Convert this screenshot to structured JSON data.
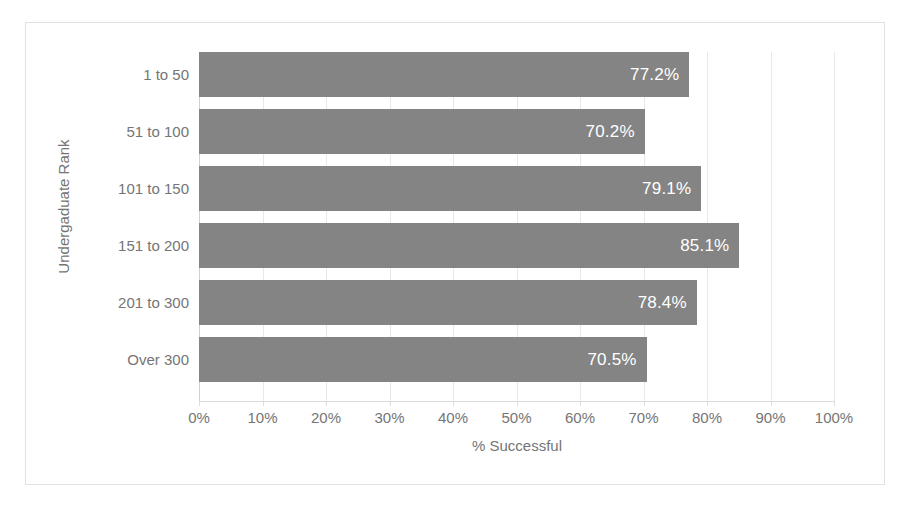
{
  "chart_data": {
    "type": "bar",
    "orientation": "horizontal",
    "title": "",
    "xlabel": "% Successful",
    "ylabel": "Undergaduate Rank",
    "categories": [
      "1 to 50",
      "51 to 100",
      "101 to 150",
      "151 to 200",
      "201 to 300",
      "Over 300"
    ],
    "values": [
      77.2,
      70.2,
      79.1,
      85.1,
      78.4,
      70.5
    ],
    "data_labels": [
      "77.2%",
      "70.2%",
      "79.1%",
      "85.1%",
      "78.4%",
      "70.5%"
    ],
    "xlim": [
      0,
      100
    ],
    "xticks": [
      0,
      10,
      20,
      30,
      40,
      50,
      60,
      70,
      80,
      90,
      100
    ],
    "xtick_labels": [
      "0%",
      "10%",
      "20%",
      "30%",
      "40%",
      "50%",
      "60%",
      "70%",
      "80%",
      "90%",
      "100%"
    ],
    "grid": "vertical",
    "legend": "none",
    "series": [
      {
        "name": "% Successful",
        "values": [
          77.2,
          70.2,
          79.1,
          85.1,
          78.4,
          70.5
        ]
      }
    ],
    "colors": {
      "bar": "#848484",
      "data_label_text": "#ffffff",
      "axis_text": "#757575",
      "gridline": "#e8e8e8",
      "frame_border": "#e2e2e2",
      "background": "#ffffff"
    }
  }
}
